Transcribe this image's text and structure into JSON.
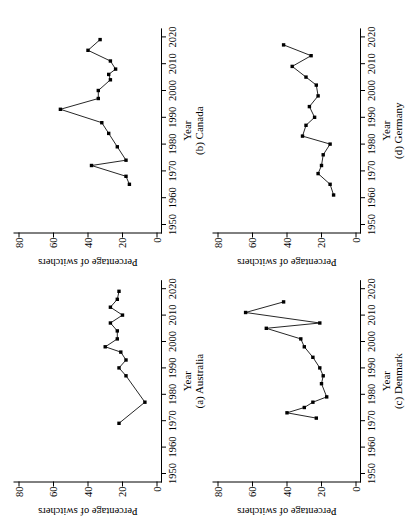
{
  "figure": {
    "background": "#ffffff",
    "ink_color": "#000000",
    "marker_shape": "filled-square"
  },
  "chart_data": [
    {
      "type": "line",
      "caption": "(a) Australia",
      "xlabel": "Year",
      "ylabel": "Percentage of switchers",
      "xlim": [
        1950,
        2020
      ],
      "ylim": [
        0,
        80
      ],
      "xticks": [
        1950,
        1960,
        1970,
        1980,
        1990,
        2000,
        2010,
        2020
      ],
      "yticks": [
        0,
        20,
        40,
        60,
        80
      ],
      "grid": false,
      "x": [
        1969,
        1977,
        1987,
        1990,
        1993,
        1996,
        1998,
        2001,
        2004,
        2007,
        2010,
        2013,
        2016,
        2019
      ],
      "y": [
        22,
        7,
        18,
        22,
        18,
        21,
        30,
        23,
        23,
        27,
        20,
        27,
        23,
        22
      ]
    },
    {
      "type": "line",
      "caption": "(b) Canada",
      "xlabel": "Year",
      "ylabel": "Percentage of switchers",
      "xlim": [
        1950,
        2020
      ],
      "ylim": [
        0,
        80
      ],
      "xticks": [
        1950,
        1960,
        1970,
        1980,
        1990,
        2000,
        2010,
        2020
      ],
      "yticks": [
        0,
        20,
        40,
        60,
        80
      ],
      "grid": false,
      "x": [
        1965,
        1968,
        1972,
        1974,
        1979,
        1984,
        1988,
        1993,
        1997,
        2000,
        2004,
        2006,
        2008,
        2011,
        2015,
        2019
      ],
      "y": [
        16,
        18,
        38,
        18,
        23,
        28,
        32,
        56,
        34,
        34,
        27,
        28,
        24,
        27,
        40,
        33
      ]
    },
    {
      "type": "line",
      "caption": "(c) Denmark",
      "xlabel": "Year",
      "ylabel": "Percentage of switchers",
      "xlim": [
        1950,
        2020
      ],
      "ylim": [
        0,
        80
      ],
      "xticks": [
        1950,
        1960,
        1970,
        1980,
        1990,
        2000,
        2010,
        2020
      ],
      "yticks": [
        0,
        20,
        40,
        60,
        80
      ],
      "grid": false,
      "x": [
        1971,
        1973,
        1975,
        1977,
        1979,
        1984,
        1987,
        1990,
        1994,
        1998,
        2001,
        2005,
        2007,
        2011,
        2015
      ],
      "y": [
        23,
        40,
        30,
        25,
        17,
        20,
        19,
        21,
        25,
        30,
        32,
        52,
        21,
        64,
        42
      ]
    },
    {
      "type": "line",
      "caption": "(d) Germany",
      "xlabel": "Year",
      "ylabel": "Percentage of switchers",
      "xlim": [
        1950,
        2020
      ],
      "ylim": [
        0,
        80
      ],
      "xticks": [
        1950,
        1960,
        1970,
        1980,
        1990,
        2000,
        2010,
        2020
      ],
      "yticks": [
        0,
        20,
        40,
        60,
        80
      ],
      "grid": false,
      "x": [
        1961,
        1965,
        1969,
        1972,
        1976,
        1980,
        1983,
        1987,
        1990,
        1994,
        1998,
        2002,
        2005,
        2009,
        2013,
        2017
      ],
      "y": [
        13,
        15,
        22,
        20,
        19,
        15,
        31,
        29,
        24,
        27,
        22,
        23,
        29,
        37,
        26,
        42
      ]
    }
  ]
}
